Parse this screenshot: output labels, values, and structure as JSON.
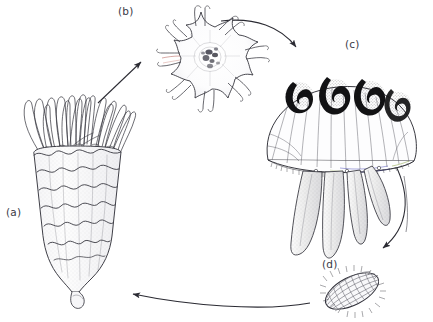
{
  "figure": {
    "background_color": "#ffffff",
    "ink_color": "#2b2b33",
    "label_color": "#3a3a46",
    "width": 433,
    "height": 322
  },
  "labels": {
    "a": "(a)",
    "b": "(b)",
    "c": "(c)",
    "d": "(d)"
  },
  "stages": [
    {
      "key": "a",
      "label": "(a)",
      "name": "strobila-polyp",
      "description": "Strobilating scyphistoma polyp with crown of long tentacles and stacked segmented discs",
      "segment_count": 6,
      "tentacle_count": 18
    },
    {
      "key": "b",
      "label": "(b)",
      "name": "ephyra",
      "description": "Free-swimming ephyra larva with eight bifurcated marginal lappets",
      "lappet_count": 8
    },
    {
      "key": "c",
      "label": "(c)",
      "name": "adult-medusa",
      "description": "Adult medusa with domed bell, four dark horseshoe gonads and four frilled oral arms",
      "gonad_count": 4,
      "oral_arm_count": 4,
      "gonad_color": "#151515",
      "margin_accent_colors": [
        "#4a4ab8",
        "#7f9a2e"
      ]
    },
    {
      "key": "d",
      "label": "(d)",
      "name": "planula-larva",
      "description": "Ciliated planula larva, elongated oval covered in fine cilia",
      "cilia": true
    }
  ],
  "arrows": [
    {
      "name": "arrow-a-to-b",
      "from": "a",
      "to": "b",
      "style": "straight",
      "direction": "up-right"
    },
    {
      "name": "arrow-b-to-c",
      "from": "b",
      "to": "c",
      "style": "curved",
      "direction": "right-down"
    },
    {
      "name": "arrow-c-to-d",
      "from": "c",
      "to": "d",
      "style": "curved",
      "direction": "down"
    },
    {
      "name": "arrow-d-to-a",
      "from": "d",
      "to": "a",
      "style": "curved",
      "direction": "left"
    }
  ]
}
